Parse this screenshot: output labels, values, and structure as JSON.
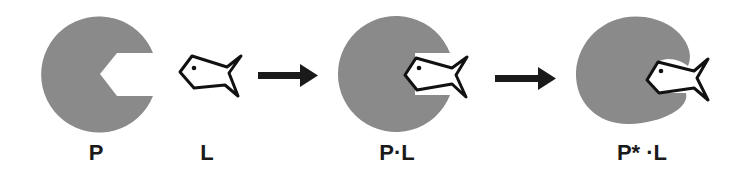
{
  "diagram": {
    "colors": {
      "protein_fill": "#8a8a8a",
      "ligand_stroke": "#111111",
      "ligand_fill": "#ffffff",
      "arrow": "#1a1a1a",
      "label": "#1a1a1a"
    },
    "stages": [
      {
        "id": "protein",
        "label": "P",
        "shape": "circle-with-notch"
      },
      {
        "id": "ligand",
        "label": "L",
        "shape": "fish"
      },
      {
        "id": "complex",
        "label": "P·L",
        "shape": "circle-with-bound-fish"
      },
      {
        "id": "induced-complex",
        "label": "P* ·L",
        "shape": "deformed-blob-with-bound-fish"
      }
    ],
    "arrows": [
      {
        "from": "ligand",
        "to": "complex",
        "icon": "right-arrow"
      },
      {
        "from": "complex",
        "to": "induced-complex",
        "icon": "right-arrow"
      }
    ]
  }
}
